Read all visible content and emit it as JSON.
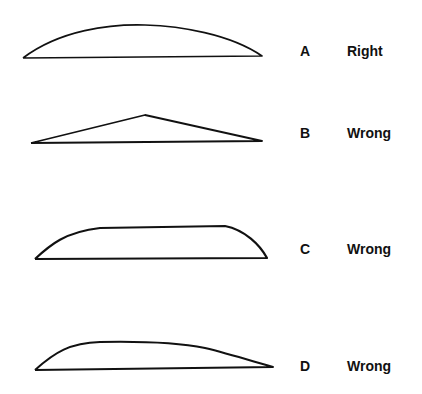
{
  "figure": {
    "background": "#ffffff",
    "stroke_color": "#111111",
    "rows": [
      {
        "letter": "A",
        "verdict": "Right",
        "shape": "smooth-symmetric-arc",
        "path": "M23,58 C60,30 110,24 145,25 C180,26 230,34 262,56 L23,58",
        "letter_top": 44,
        "verdict_top": 44
      },
      {
        "letter": "B",
        "verdict": "Wrong",
        "shape": "pointed-peak",
        "path": "M31,143 L145,115 L262,141 L31,143",
        "letter_top": 126,
        "verdict_top": 126
      },
      {
        "letter": "C",
        "verdict": "Wrong",
        "shape": "flat-top",
        "path": "M35,259 C50,245 65,232 100,228 L225,226 C245,230 260,245 267,258 L35,259",
        "letter_top": 242,
        "verdict_top": 242
      },
      {
        "letter": "D",
        "verdict": "Wrong",
        "shape": "front-loaded-hump",
        "path": "M35,370 C55,352 70,343 100,342 C150,341 180,343 205,348 C230,354 255,362 273,367 L35,370",
        "letter_top": 359,
        "verdict_top": 359
      }
    ]
  }
}
